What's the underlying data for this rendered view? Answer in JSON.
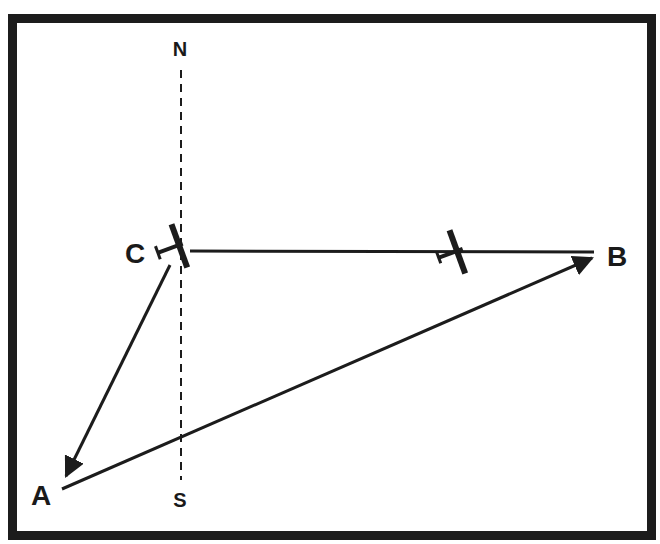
{
  "diagram": {
    "type": "wind-triangle navigation diagram",
    "labels": {
      "north": "N",
      "south": "S",
      "point_a": "A",
      "point_b": "B",
      "point_c": "C"
    },
    "points": {
      "A": [
        62,
        489
      ],
      "B": [
        596,
        254
      ],
      "C": [
        180,
        250
      ],
      "N_top": [
        180,
        65
      ],
      "S_bottom": [
        180,
        475
      ]
    },
    "edges": [
      {
        "from": "C",
        "to": "B",
        "style": "solid",
        "arrow": "none",
        "note": "course line with aircraft"
      },
      {
        "from": "C",
        "to": "A",
        "style": "solid",
        "arrow": "end"
      },
      {
        "from": "A",
        "to": "B",
        "style": "solid",
        "arrow": "end"
      },
      {
        "from": "N",
        "to": "S",
        "style": "dashed",
        "arrow": "none",
        "note": "north-south meridian"
      }
    ],
    "aircraft": [
      {
        "position": "at C",
        "heading": "west-northwest"
      },
      {
        "position": "on C-B line",
        "heading": "west-northwest"
      }
    ],
    "colors": {
      "ink": "#1c1c1c",
      "background": "#ffffff"
    }
  }
}
